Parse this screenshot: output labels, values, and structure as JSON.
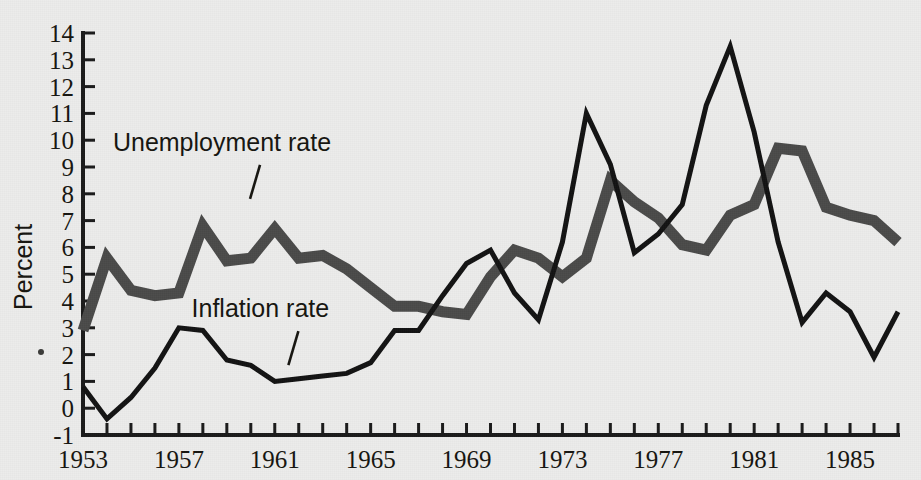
{
  "chart_data": {
    "type": "line",
    "title": "",
    "xlabel": "",
    "ylabel": "Percent",
    "xlim": [
      1953,
      1987
    ],
    "ylim": [
      -1,
      14
    ],
    "grid": false,
    "legend_position": "inline-annotations",
    "x": [
      1953,
      1954,
      1955,
      1956,
      1957,
      1958,
      1959,
      1960,
      1961,
      1962,
      1963,
      1964,
      1965,
      1966,
      1967,
      1968,
      1969,
      1970,
      1971,
      1972,
      1973,
      1974,
      1975,
      1976,
      1977,
      1978,
      1979,
      1980,
      1981,
      1982,
      1983,
      1984,
      1985,
      1986,
      1987
    ],
    "x_tick_labels": [
      "1953",
      "1957",
      "1961",
      "1965",
      "1969",
      "1973",
      "1977",
      "1981",
      "1985"
    ],
    "x_tick_label_values": [
      1953,
      1957,
      1961,
      1965,
      1969,
      1973,
      1977,
      1981,
      1985
    ],
    "y_tick_labels": [
      "-1",
      "0",
      "1",
      "2",
      "3",
      "4",
      "5",
      "6",
      "7",
      "8",
      "9",
      "10",
      "11",
      "12",
      "13",
      "14"
    ],
    "y_tick_values": [
      -1,
      0,
      1,
      2,
      3,
      4,
      5,
      6,
      7,
      8,
      9,
      10,
      11,
      12,
      13,
      14
    ],
    "series": [
      {
        "name": "Unemployment rate",
        "color": "#4a4a49",
        "style": "thick-gray",
        "values": [
          2.9,
          5.6,
          4.4,
          4.2,
          4.3,
          6.8,
          5.5,
          5.6,
          6.7,
          5.6,
          5.7,
          5.2,
          4.5,
          3.8,
          3.8,
          3.6,
          3.5,
          4.9,
          5.9,
          5.6,
          4.9,
          5.6,
          8.5,
          7.7,
          7.1,
          6.1,
          5.9,
          7.2,
          7.6,
          9.7,
          9.6,
          7.5,
          7.2,
          7.0,
          6.2
        ]
      },
      {
        "name": "Inflation rate",
        "color": "#121212",
        "style": "thin-black",
        "values": [
          0.8,
          -0.4,
          0.4,
          1.5,
          3.0,
          2.9,
          1.8,
          1.6,
          1.0,
          1.1,
          1.2,
          1.3,
          1.7,
          2.9,
          2.9,
          4.2,
          5.4,
          5.9,
          4.3,
          3.3,
          6.2,
          11.0,
          9.1,
          5.8,
          6.5,
          7.6,
          11.3,
          13.5,
          10.3,
          6.2,
          3.2,
          4.3,
          3.6,
          1.9,
          3.6
        ]
      }
    ],
    "annotations": [
      {
        "text": "Unemployment rate",
        "x": 1958.8,
        "y": 9.6
      },
      {
        "text": "Inflation rate",
        "x": 1960.4,
        "y": 3.4
      }
    ]
  },
  "axis": {
    "y_axis_title": "Percent"
  }
}
